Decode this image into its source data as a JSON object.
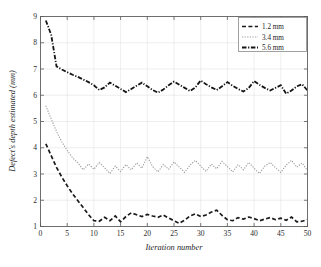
{
  "chart_data": {
    "type": "line",
    "title": "",
    "xlabel": "Iteration number",
    "ylabel": "Defect's depth estimated (mm)",
    "xlim": [
      0,
      50
    ],
    "ylim": [
      1,
      9
    ],
    "xticks": [
      0,
      5,
      10,
      15,
      20,
      25,
      30,
      35,
      40,
      45,
      50
    ],
    "yticks": [
      1,
      2,
      3,
      4,
      5,
      6,
      7,
      8,
      9
    ],
    "grid": true,
    "legend_position": "top-right",
    "x": [
      1,
      2,
      3,
      4,
      5,
      6,
      7,
      8,
      9,
      10,
      11,
      12,
      13,
      14,
      15,
      16,
      17,
      18,
      19,
      20,
      21,
      22,
      23,
      24,
      25,
      26,
      27,
      28,
      29,
      30,
      31,
      32,
      33,
      34,
      35,
      36,
      37,
      38,
      39,
      40,
      41,
      42,
      43,
      44,
      45,
      46,
      47,
      48,
      49,
      50
    ],
    "series": [
      {
        "name": "1.2 mm",
        "label": "1.2 mm",
        "color": "#1a1a1a",
        "dash": "4,2.4",
        "width": 1.7,
        "values": [
          4.15,
          3.7,
          3.25,
          2.88,
          2.55,
          2.25,
          1.98,
          1.72,
          1.45,
          1.22,
          1.2,
          1.35,
          1.22,
          1.4,
          1.18,
          1.38,
          1.52,
          1.45,
          1.38,
          1.46,
          1.4,
          1.35,
          1.44,
          1.32,
          1.22,
          1.12,
          1.24,
          1.4,
          1.48,
          1.38,
          1.44,
          1.55,
          1.62,
          1.42,
          1.26,
          1.22,
          1.34,
          1.28,
          1.36,
          1.3,
          1.22,
          1.28,
          1.34,
          1.26,
          1.32,
          1.24,
          1.36,
          1.18,
          1.2,
          1.26
        ]
      },
      {
        "name": "3.4 mm",
        "label": "3.4 mm",
        "color": "#9a9a9a",
        "dash": "1.2,1.4",
        "width": 1.1,
        "values": [
          5.6,
          5.1,
          4.62,
          4.22,
          3.9,
          3.62,
          3.42,
          3.16,
          3.38,
          3.18,
          3.44,
          3.24,
          3.02,
          3.3,
          3.1,
          3.36,
          3.16,
          3.42,
          3.22,
          3.66,
          3.28,
          3.08,
          3.36,
          3.18,
          3.46,
          3.26,
          3.06,
          3.34,
          3.52,
          3.3,
          3.1,
          3.38,
          3.2,
          3.48,
          3.28,
          3.08,
          3.36,
          3.16,
          3.44,
          3.22,
          3.02,
          3.3,
          3.44,
          3.24,
          3.06,
          3.34,
          3.52,
          3.26,
          3.42,
          3.12
        ]
      },
      {
        "name": "5.6 mm",
        "label": "5.6 mm",
        "color": "#151515",
        "dash": "4.5,1.6,1.2,1.6",
        "width": 1.8,
        "values": [
          8.85,
          8.3,
          7.1,
          6.98,
          6.88,
          6.78,
          6.7,
          6.6,
          6.5,
          6.38,
          6.2,
          6.3,
          6.48,
          6.36,
          6.24,
          6.12,
          6.24,
          6.36,
          6.48,
          6.34,
          6.2,
          6.1,
          6.22,
          6.38,
          6.52,
          6.4,
          6.28,
          6.16,
          6.3,
          6.56,
          6.42,
          6.3,
          6.2,
          6.34,
          6.5,
          6.36,
          6.24,
          6.14,
          6.28,
          6.54,
          6.4,
          6.28,
          6.18,
          6.28,
          6.38,
          6.06,
          6.18,
          6.34,
          6.42,
          6.18
        ]
      }
    ]
  },
  "legend": {
    "entries": [
      {
        "label": "1.2 mm"
      },
      {
        "label": "3.4 mm"
      },
      {
        "label": "5.6 mm"
      }
    ]
  },
  "axes": {
    "xlabel": "Iteration number",
    "ylabel": "Defect's depth estimated (mm)",
    "xtick_labels": [
      "0",
      "5",
      "10",
      "15",
      "20",
      "25",
      "30",
      "35",
      "40",
      "45",
      "50"
    ],
    "ytick_labels": [
      "1",
      "2",
      "3",
      "4",
      "5",
      "6",
      "7",
      "8",
      "9"
    ]
  },
  "colors": {
    "background": "#ffffff",
    "frame": "#6e6e6e",
    "grid": "#e2e2e2",
    "series_1_2": "#1a1a1a",
    "series_3_4": "#9a9a9a",
    "series_5_6": "#151515"
  }
}
